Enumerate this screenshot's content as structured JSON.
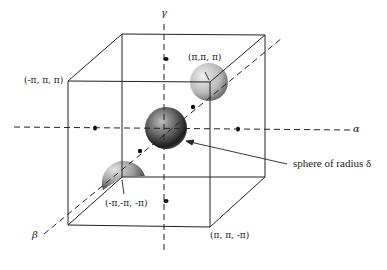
{
  "diagram": {
    "type": "cube-with-spheres",
    "axes": {
      "alpha": "α",
      "beta": "β",
      "gamma": "γ"
    },
    "corner_labels": {
      "top_left_front": "(-π, π, π)",
      "top_right_back": "(π,π, π)",
      "bottom_left_back": "(-π,-π, -π)",
      "bottom_right_front": "(π, π, -π)"
    },
    "annotation": "sphere of radius δ",
    "colors": {
      "line": "#222222",
      "sphere_light": "#d8d8d8",
      "sphere_dark": "#1a1a1a",
      "background": "#ffffff"
    }
  }
}
